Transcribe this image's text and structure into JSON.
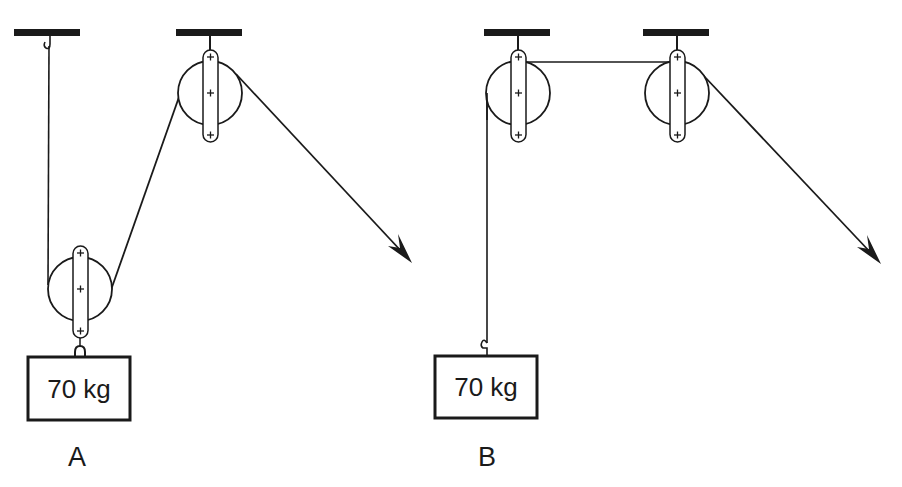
{
  "diagram": {
    "type": "pulley-systems",
    "ink_color": "#1a1a1a",
    "background": "#ffffff",
    "systems": [
      {
        "id": "A",
        "label": "A",
        "mass_label": "70 kg",
        "description": "Movable pulley attached to mass, rope from ceiling hook over movable pulley to fixed pulley, pulled diagonally"
      },
      {
        "id": "B",
        "label": "B",
        "mass_label": "70 kg",
        "description": "Two fixed pulleys, rope hooked to mass, pulled diagonally"
      }
    ]
  }
}
